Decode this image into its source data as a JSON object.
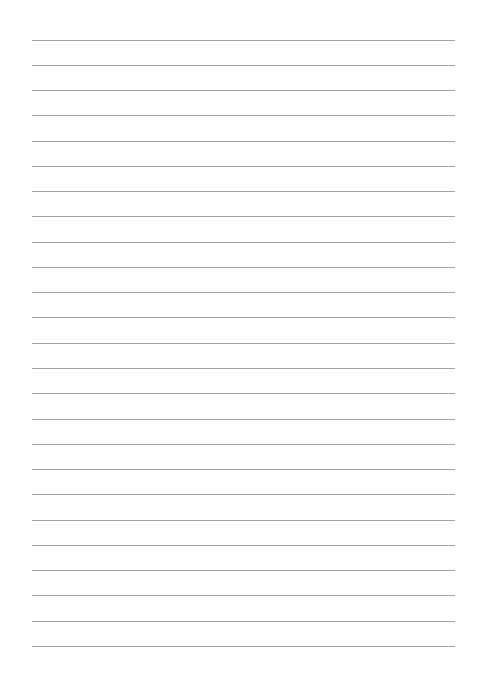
{
  "page": {
    "type": "lined-paper",
    "background_color": "#ffffff",
    "rule_color": "#a4a4a4",
    "rule_count": 25,
    "rule_left": 32,
    "rule_right": 455,
    "first_rule_y": 39.5,
    "rule_spacing": 25.27
  }
}
